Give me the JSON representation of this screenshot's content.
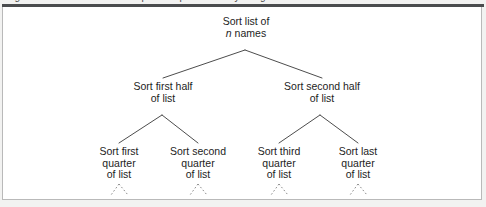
{
  "figure": {
    "caption_partial": "Figure 1  The recursive decomposition performed by merge sort on a list of n names",
    "rule_color": "#4a4c4e",
    "frame_border_color": "#b9b9b9",
    "background_color": "#ffffff",
    "page_color": "#f2f2f1",
    "text_color": "#1d1d1d"
  },
  "tree": {
    "type": "recursion-tree",
    "levels": 3,
    "root": {
      "id": "root",
      "line1": "Sort list of",
      "line2_prefix": "n",
      "line2_suffix": " names"
    },
    "level1": [
      {
        "id": "sort-first-half",
        "line1": "Sort first half",
        "line2": "of list"
      },
      {
        "id": "sort-second-half",
        "line1": "Sort second half",
        "line2": "of list"
      }
    ],
    "level2": [
      {
        "id": "sort-first-quarter",
        "line1": "Sort first",
        "line2": "quarter",
        "line3": "of list"
      },
      {
        "id": "sort-second-quarter",
        "line1": "Sort second",
        "line2": "quarter",
        "line3": "of list"
      },
      {
        "id": "sort-third-quarter",
        "line1": "Sort third",
        "line2": "quarter",
        "line3": "of list"
      },
      {
        "id": "sort-last-quarter",
        "line1": "Sort last",
        "line2": "quarter",
        "line3": "of list"
      }
    ],
    "continuation": {
      "style": "dashed",
      "count": 4,
      "meaning": "recursion continues"
    }
  }
}
